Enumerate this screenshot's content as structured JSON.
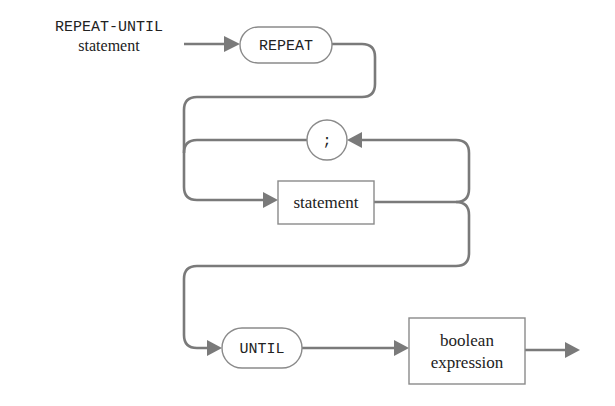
{
  "diagram": {
    "type": "syntax-diagram",
    "title": {
      "keyword": "REPEAT-UNTIL",
      "subtitle": "statement"
    },
    "nodes": [
      {
        "id": "repeat",
        "kind": "terminal",
        "shape": "rounded",
        "label": "REPEAT"
      },
      {
        "id": "semicolon",
        "kind": "terminal",
        "shape": "circle",
        "label": ";"
      },
      {
        "id": "statement",
        "kind": "nonterminal",
        "shape": "rectangle",
        "label": "statement"
      },
      {
        "id": "until",
        "kind": "terminal",
        "shape": "rounded",
        "label": "UNTIL"
      },
      {
        "id": "boolean_expression",
        "kind": "nonterminal",
        "shape": "rectangle",
        "label_line1": "boolean",
        "label_line2": "expression"
      }
    ],
    "edges": [
      {
        "from": "start",
        "to": "repeat"
      },
      {
        "from": "repeat",
        "to": "statement"
      },
      {
        "from": "statement",
        "to": "semicolon"
      },
      {
        "from": "semicolon",
        "to": "statement"
      },
      {
        "from": "statement",
        "to": "until"
      },
      {
        "from": "until",
        "to": "boolean_expression"
      },
      {
        "from": "boolean_expression",
        "to": "end"
      }
    ],
    "colors": {
      "line": "#7a7a7a",
      "node_border": "#8a8a8a",
      "text": "#222222",
      "background": "#ffffff"
    }
  }
}
